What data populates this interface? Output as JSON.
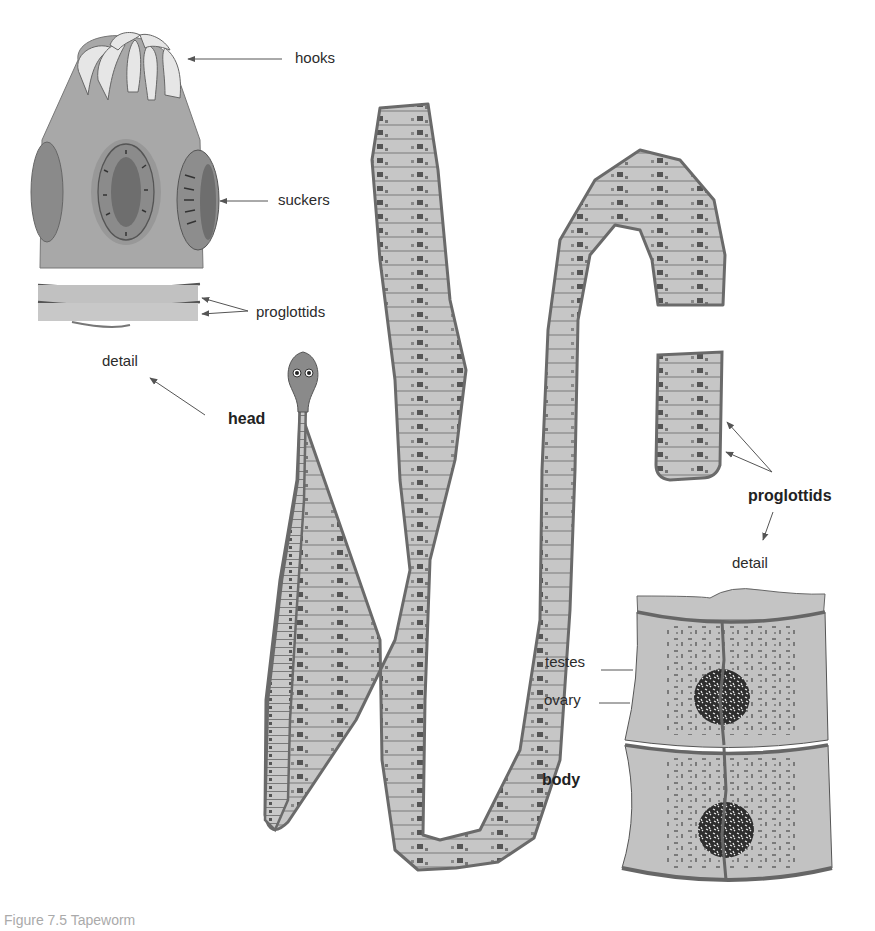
{
  "figure": {
    "caption": "Figure 7.5  Tapeworm",
    "colors": {
      "body_fill": "#a9a9a9",
      "body_stroke": "#6e6e6e",
      "segment_fill": "#c4c4c4",
      "hook_fill": "#e8e8e8",
      "sucker_dark": "#7a7a7a",
      "dark_mark": "#3a3a3a",
      "arrow": "#555555"
    }
  },
  "head_detail": {
    "title": "detail",
    "labels": {
      "hooks": "hooks",
      "suckers": "suckers",
      "proglottids": "proglottids"
    }
  },
  "worm": {
    "head_label": "head",
    "proglottids_label": "proglottids",
    "detail_label": "detail"
  },
  "body_detail": {
    "labels": {
      "testes": "testes",
      "ovary": "ovary",
      "body": "body"
    }
  }
}
